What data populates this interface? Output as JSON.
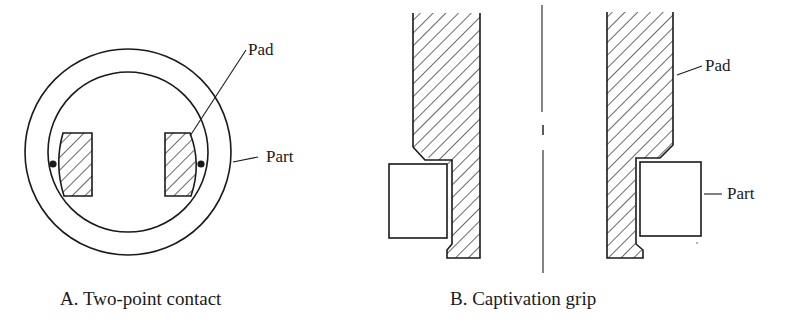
{
  "figure": {
    "panel_a": {
      "caption": "A.  Two-point contact",
      "callouts": {
        "pad": "Pad",
        "part": "Part"
      }
    },
    "panel_b": {
      "caption": "B.  Captivation grip",
      "callouts": {
        "pad": "Pad",
        "part": "Part"
      }
    },
    "colors": {
      "ink": "#1a1a1a",
      "background": "#ffffff"
    }
  }
}
